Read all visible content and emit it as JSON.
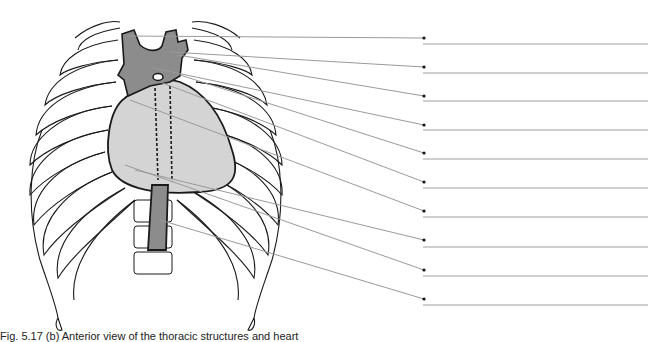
{
  "figure": {
    "caption": "Fig. 5.17 (b) Anterior view of the thoracic structures and heart"
  },
  "colors": {
    "outline": "#1a1a1a",
    "great_vessels_fill": "#8c8c8c",
    "heart_fill": "#d4d4d4",
    "leader_line": "#9a9a9a",
    "answer_line": "#a0a0a0",
    "dot": "#111111"
  },
  "labels": [
    {
      "index": 1,
      "origin": [
        128,
        36
      ],
      "dot": [
        424,
        38
      ],
      "line_y": 44,
      "text": ""
    },
    {
      "index": 2,
      "origin": [
        170,
        52
      ],
      "dot": [
        424,
        67
      ],
      "line_y": 73,
      "text": ""
    },
    {
      "index": 3,
      "origin": [
        178,
        55
      ],
      "dot": [
        424,
        96
      ],
      "line_y": 101,
      "text": ""
    },
    {
      "index": 4,
      "origin": [
        153,
        68
      ],
      "dot": [
        424,
        125
      ],
      "line_y": 130,
      "text": ""
    },
    {
      "index": 5,
      "origin": [
        180,
        75
      ],
      "dot": [
        424,
        153
      ],
      "line_y": 159,
      "text": ""
    },
    {
      "index": 6,
      "origin": [
        160,
        82
      ],
      "dot": [
        424,
        182
      ],
      "line_y": 188,
      "text": ""
    },
    {
      "index": 7,
      "origin": [
        130,
        100
      ],
      "dot": [
        424,
        211
      ],
      "line_y": 217,
      "text": ""
    },
    {
      "index": 8,
      "origin": [
        135,
        170
      ],
      "dot": [
        424,
        240
      ],
      "line_y": 247,
      "text": ""
    },
    {
      "index": 9,
      "origin": [
        125,
        165
      ],
      "dot": [
        424,
        270
      ],
      "line_y": 276,
      "text": ""
    },
    {
      "index": 10,
      "origin": [
        160,
        220
      ],
      "dot": [
        424,
        299
      ],
      "line_y": 305,
      "text": ""
    }
  ],
  "answer_line": {
    "x_start": 423,
    "x_end": 648
  }
}
